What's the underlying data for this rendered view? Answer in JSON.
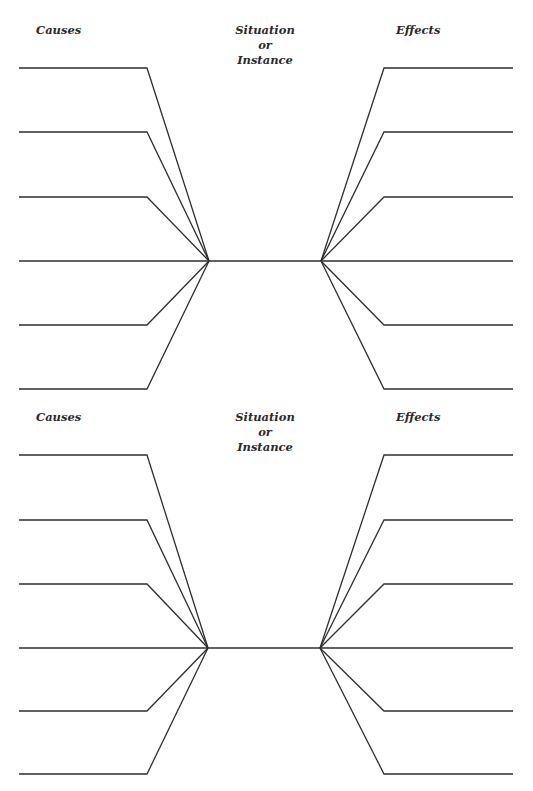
{
  "worksheet": {
    "diagrams": [
      {
        "causes_label": "Causes",
        "situation_line1": "Situation",
        "situation_line2": "or",
        "situation_line3": "Instance",
        "effects_label": "Effects",
        "cause_lines": 6,
        "effect_lines": 6
      },
      {
        "causes_label": "Causes",
        "situation_line1": "Situation",
        "situation_line2": "or",
        "situation_line3": "Instance",
        "effects_label": "Effects",
        "cause_lines": 6,
        "effect_lines": 6
      }
    ],
    "colors": {
      "line": "#2e2e2e",
      "text": "#2a2a2a",
      "background": "#ffffff"
    }
  }
}
